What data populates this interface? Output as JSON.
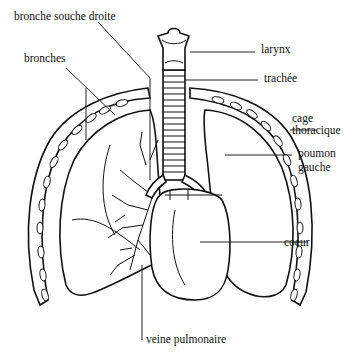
{
  "diagram": {
    "language": "fr",
    "labels": {
      "bronche_souche_droite": "bronche souche droite",
      "bronches": "bronches",
      "larynx": "larynx",
      "trachee": "trachée",
      "cage_thoracique_1": "cage",
      "cage_thoracique_2": "thoracique",
      "poumon_gauche_1": "poumon",
      "poumon_gauche_2": "gauche",
      "coeur": "coeur",
      "veine_pulmonaire": "veine pulmonaire"
    },
    "colors": {
      "background": "#ffffff",
      "ink": "#111111"
    }
  }
}
